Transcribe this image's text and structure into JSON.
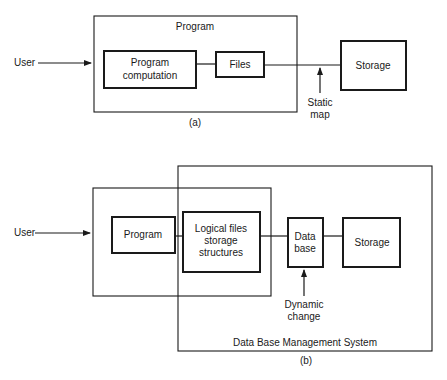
{
  "diagram_a": {
    "caption": "(a)",
    "user_label": "User",
    "program_container_label": "Program",
    "program_computation": [
      "Program",
      "computation"
    ],
    "files_label": "Files",
    "storage_label": "Storage",
    "static_map": [
      "Static",
      "map"
    ]
  },
  "diagram_b": {
    "caption": "(b)",
    "user_label": "User",
    "program_label": "Program",
    "logical_files": [
      "Logical files",
      "storage",
      "structures"
    ],
    "data_base": [
      "Data",
      "base"
    ],
    "storage_label": "Storage",
    "dynamic_change": [
      "Dynamic",
      "change"
    ],
    "dbms_label": "Data Base Management System"
  },
  "colors": {
    "ink": "#1a1a1a",
    "background": "#ffffff"
  }
}
